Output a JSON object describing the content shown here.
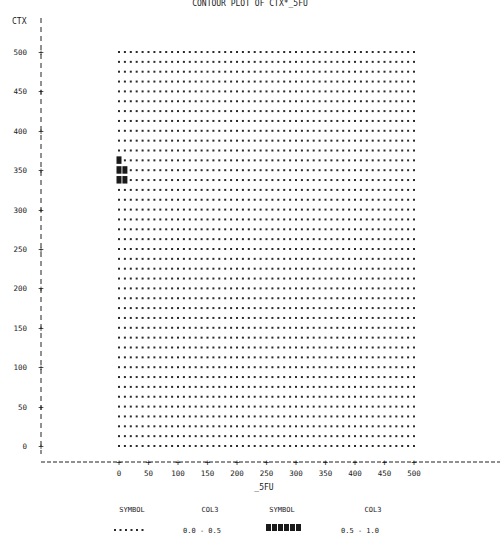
{
  "chart_data": {
    "type": "heatmap",
    "title": "CONTOUR PLOT OF CTX*_5FU",
    "xlabel": "_5FU",
    "ylabel": "CTX",
    "xlim": [
      0,
      500
    ],
    "ylim": [
      0,
      500
    ],
    "x_step": 10,
    "y_step": 12.5,
    "xticks": [
      0,
      50,
      100,
      150,
      200,
      250,
      300,
      350,
      400,
      450,
      500
    ],
    "yticks": [
      0,
      50,
      100,
      150,
      200,
      250,
      300,
      350,
      400,
      450,
      500
    ],
    "grid": false,
    "default_level": "0.0 - 0.5",
    "high_cells": [
      {
        "x": 0,
        "y": 362.5
      },
      {
        "x": 0,
        "y": 350
      },
      {
        "x": 10,
        "y": 350
      },
      {
        "x": 0,
        "y": 337.5
      },
      {
        "x": 10,
        "y": 337.5
      }
    ],
    "legend": {
      "placement": "bottom",
      "symbol_header": "SYMBOL",
      "value_header": "COL3",
      "entries": [
        {
          "symbol": "......",
          "range": "0.0 - 0.5"
        },
        {
          "symbol": "######",
          "range": "0.5 - 1.0"
        }
      ]
    }
  }
}
